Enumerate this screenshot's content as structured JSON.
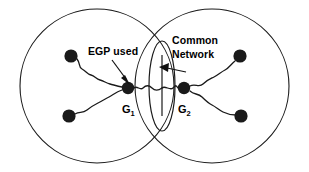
{
  "figure": {
    "background_color": "#ffffff",
    "stroke_color": "#1a1a1a",
    "width": 309,
    "height": 172
  },
  "domains": [
    {
      "id": "left-domain",
      "name": "left-autonomous-system",
      "cx": 97,
      "cy": 86,
      "r": 77
    },
    {
      "id": "right-domain",
      "name": "right-autonomous-system",
      "cx": 212,
      "cy": 86,
      "r": 77
    }
  ],
  "common_network": {
    "label_line1": "Common",
    "label_line2": "Network",
    "label_x": 172,
    "label_y": 44,
    "lens_cx": 162,
    "lens_cy": 86,
    "lens_rx": 13,
    "lens_ry": 45,
    "bus_x": 162,
    "bus_top": 55,
    "bus_bottom": 116
  },
  "egp_callout": {
    "label": "EGP used",
    "label_x": 88,
    "label_y": 55
  },
  "gateways": [
    {
      "id": "g1",
      "base": "G",
      "subscript": "1",
      "node_x": 128,
      "node_y": 88,
      "node_r": 6.2,
      "label_x": 122,
      "label_y": 113
    },
    {
      "id": "g2",
      "base": "G",
      "subscript": "2",
      "node_x": 184,
      "node_y": 88,
      "node_r": 6.2,
      "label_x": 178,
      "label_y": 113
    }
  ],
  "host_nodes": [
    {
      "id": "host-left-upper",
      "cx": 71,
      "cy": 56,
      "r": 6.6
    },
    {
      "id": "host-left-lower",
      "cx": 69,
      "cy": 116,
      "r": 6.6
    },
    {
      "id": "host-right-upper",
      "cx": 240,
      "cy": 56,
      "r": 6.6
    },
    {
      "id": "host-right-lower",
      "cx": 241,
      "cy": 116,
      "r": 6.6
    }
  ],
  "links": [
    {
      "id": "link-g1-upper",
      "from": "host-left-upper",
      "to": "g1",
      "style": "wavy"
    },
    {
      "id": "link-g1-lower",
      "from": "host-left-lower",
      "to": "g1",
      "style": "wavy"
    },
    {
      "id": "link-g1-bus",
      "from": "g1",
      "to": "common-network",
      "style": "wavy"
    },
    {
      "id": "link-g2-bus",
      "from": "common-network",
      "to": "g2",
      "style": "wavy"
    },
    {
      "id": "link-g2-upper",
      "from": "g2",
      "to": "host-right-upper",
      "style": "wavy"
    },
    {
      "id": "link-g2-lower",
      "from": "g2",
      "to": "host-right-lower",
      "style": "wavy"
    }
  ]
}
